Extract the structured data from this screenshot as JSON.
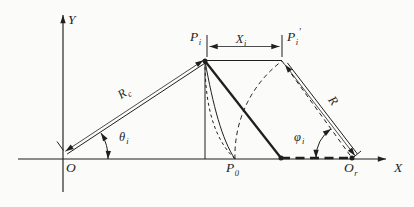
{
  "figure": {
    "colors": {
      "ink": "#1f1f1f",
      "background": "#fbfbf9"
    }
  },
  "axes": {
    "x_label": "X",
    "y_label": "Y",
    "origin_label": "O"
  },
  "points": {
    "p_i": {
      "base": "P",
      "sub": "i"
    },
    "p_i_prime": {
      "base": "P",
      "sub": "i",
      "prime": "′"
    },
    "p_0": {
      "base": "P",
      "sub": "0"
    },
    "o_r": {
      "base": "O",
      "sub": "r"
    }
  },
  "dimensions": {
    "r_c": {
      "base": "R",
      "sub": "c"
    },
    "r": {
      "base": "R"
    },
    "x_i": {
      "base": "X",
      "sub": "i"
    }
  },
  "angles": {
    "theta_i": {
      "base": "θ",
      "sub": "i"
    },
    "phi_i": {
      "base": "φ",
      "sub": "i"
    }
  }
}
